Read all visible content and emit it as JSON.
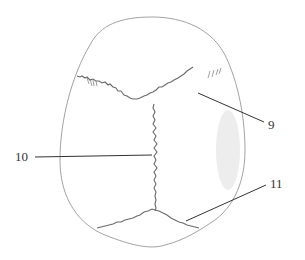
{
  "figure": {
    "colors": {
      "outline": "#8a8a8a",
      "suture": "#6a6a6a",
      "leader": "#333333",
      "shading": "#c8c8c8"
    },
    "labels": [
      {
        "id": "9",
        "text": "9",
        "x": 268,
        "y": 122
      },
      {
        "id": "10",
        "text": "10",
        "x": 15,
        "y": 153
      },
      {
        "id": "11",
        "text": "11",
        "x": 270,
        "y": 180
      }
    ]
  }
}
